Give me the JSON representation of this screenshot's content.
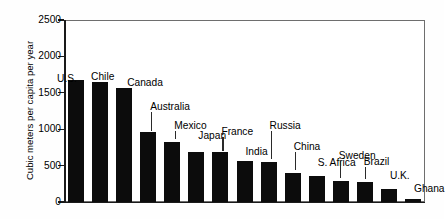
{
  "chart_data": {
    "type": "bar",
    "title": "",
    "subtitle": "",
    "xlabel": "",
    "ylabel": "Cubic meters per capita per year",
    "ylim": [
      0,
      2500
    ],
    "ytick_labels": [
      "2500",
      "2000",
      "1500",
      "1000",
      "500",
      "0"
    ],
    "ytick_values": [
      2500,
      2000,
      1500,
      1000,
      500,
      0
    ],
    "grid": false,
    "legend": "none",
    "bar_color": "#0c0c0c",
    "frame_color": "#6e6e6e",
    "categories": [
      "U.S.",
      "Chile",
      "Canada",
      "Australia",
      "Mexico",
      "Japan",
      "France",
      "India",
      "Russia",
      "China",
      "S. Africa",
      "Sweden",
      "Brazil",
      "U.K.",
      "Ghana"
    ],
    "values": [
      1670,
      1650,
      1570,
      955,
      825,
      690,
      685,
      570,
      550,
      400,
      360,
      285,
      275,
      175,
      35
    ],
    "annotations": [
      {
        "label": "U.S.",
        "value": 1670,
        "leader": false
      },
      {
        "label": "Chile",
        "value": 1650,
        "leader": false
      },
      {
        "label": "Canada",
        "value": 1570,
        "leader": false
      },
      {
        "label": "Australia",
        "value": 955,
        "leader": true
      },
      {
        "label": "Mexico",
        "value": 825,
        "leader": true
      },
      {
        "label": "Japan",
        "value": 690,
        "leader": false
      },
      {
        "label": "France",
        "value": 685,
        "leader": true
      },
      {
        "label": "India",
        "value": 570,
        "leader": false
      },
      {
        "label": "Russia",
        "value": 550,
        "leader": true
      },
      {
        "label": "China",
        "value": 400,
        "leader": true
      },
      {
        "label": "S. Africa",
        "value": 360,
        "leader": false
      },
      {
        "label": "Sweden",
        "value": 285,
        "leader": true
      },
      {
        "label": "Brazil",
        "value": 275,
        "leader": true
      },
      {
        "label": "U.K.",
        "value": 175,
        "leader": false
      },
      {
        "label": "Ghana",
        "value": 35,
        "leader": false
      }
    ]
  }
}
